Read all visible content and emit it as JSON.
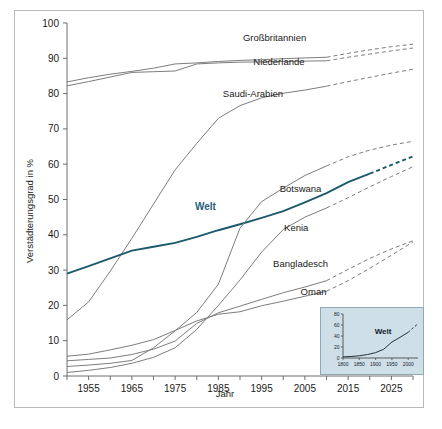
{
  "chart_data": {
    "type": "line",
    "title": "",
    "xlabel": "Jahr",
    "ylabel": "Verstädterungsgrad in %",
    "xlim": [
      1950,
      2030
    ],
    "ylim": [
      0,
      100
    ],
    "grid": false,
    "legend": "inline-labels",
    "yticks": [
      0,
      10,
      20,
      30,
      40,
      50,
      60,
      70,
      80,
      90,
      100
    ],
    "xticks": [
      1955,
      1965,
      1975,
      1985,
      1995,
      2005,
      2015,
      2025
    ],
    "xticks_minor": [
      1950,
      1960,
      1970,
      1980,
      1990,
      2000,
      2010,
      2020,
      2030
    ],
    "x": [
      1950,
      1955,
      1960,
      1965,
      1970,
      1975,
      1980,
      1985,
      1990,
      1995,
      2000,
      2005,
      2010,
      2015,
      2020,
      2025,
      2030
    ],
    "series": [
      {
        "name": "Großbritannien",
        "color": "#7d7d7d",
        "label_x": 1998,
        "label_y": 95,
        "observed": [
          83.3,
          84.5,
          85.5,
          86.3,
          87.2,
          88.4,
          88.7,
          89.1,
          89.4,
          89.6,
          89.9,
          90.1,
          90.3
        ],
        "projected": [
          90.3,
          91.4,
          92.4,
          93.3,
          94.0
        ]
      },
      {
        "name": "Niederlande",
        "color": "#7d7d7d",
        "label_x": 1999,
        "label_y": 88,
        "observed": [
          82.2,
          83.4,
          84.7,
          86.0,
          86.2,
          86.4,
          88.4,
          88.7,
          88.9,
          89.0,
          89.1,
          89.2,
          89.3
        ],
        "projected": [
          89.3,
          90.3,
          91.2,
          92.1,
          92.9
        ]
      },
      {
        "name": "Saudi-Arabien",
        "color": "#7d7d7d",
        "label_x": 1993,
        "label_y": 79,
        "observed": [
          15.9,
          21.0,
          29.7,
          39.0,
          48.7,
          58.4,
          65.9,
          73.0,
          76.6,
          78.8,
          80.1,
          81.0,
          82.1
        ],
        "projected": [
          82.1,
          83.4,
          84.6,
          85.8,
          86.9
        ]
      },
      {
        "name": "Welt",
        "color": "#1c5a6b",
        "label_x": 1982,
        "label_y": 47,
        "observed": [
          29.0,
          31.1,
          33.3,
          35.5,
          36.6,
          37.7,
          39.4,
          41.3,
          43.0,
          44.8,
          46.7,
          49.2,
          51.8,
          54.9,
          57.3
        ],
        "projected": [
          57.3,
          59.8,
          62.2
        ]
      },
      {
        "name": "Botswana",
        "color": "#7d7d7d",
        "label_x": 2004,
        "label_y": 52,
        "observed": [
          2.7,
          3.1,
          3.6,
          4.4,
          8.0,
          12.8,
          18.0,
          26.0,
          41.9,
          49.4,
          53.2,
          56.8,
          59.5
        ],
        "projected": [
          59.5,
          62.1,
          64.0,
          65.4,
          66.5
        ]
      },
      {
        "name": "Kenia",
        "color": "#7d7d7d",
        "label_x": 2003,
        "label_y": 41,
        "observed": [
          5.6,
          6.2,
          7.4,
          8.7,
          10.3,
          12.9,
          15.6,
          17.5,
          18.2,
          19.9,
          21.2,
          22.6,
          24.0
        ],
        "projected": [
          24.0,
          27.0,
          30.5,
          34.2,
          38.0
        ]
      },
      {
        "name": "Bangladesch",
        "color": "#7d7d7d",
        "label_x": 2004,
        "label_y": 31,
        "observed": [
          4.3,
          4.7,
          5.1,
          6.1,
          7.6,
          9.9,
          14.9,
          17.9,
          19.8,
          21.7,
          23.6,
          25.2,
          27.0
        ],
        "projected": [
          27.0,
          30.2,
          33.3,
          36.0,
          38.3
        ]
      },
      {
        "name": "Oman",
        "color": "#7d7d7d",
        "label_x": 2007,
        "label_y": 23,
        "observed": [
          1.0,
          1.6,
          2.4,
          3.6,
          5.3,
          8.0,
          13.2,
          20.0,
          27.2,
          35.1,
          41.5,
          45.0,
          47.6
        ],
        "projected": [
          47.6,
          50.5,
          53.6,
          56.5,
          59.3
        ]
      }
    ]
  },
  "inset": {
    "title": "",
    "series_label": "Welt",
    "ylim": [
      0,
      80
    ],
    "yticks": [
      0,
      20,
      40,
      60,
      80
    ],
    "xticks": [
      1800,
      1850,
      1900,
      1950,
      2000
    ],
    "xlim": [
      1800,
      2030
    ],
    "observed_x": [
      1800,
      1825,
      1850,
      1875,
      1900,
      1925,
      1950,
      1975,
      2000
    ],
    "observed_y": [
      2.0,
      2.8,
      4.0,
      6.3,
      9.8,
      16.0,
      29.0,
      37.7,
      46.7
    ],
    "projected_x": [
      2000,
      2015,
      2030
    ],
    "projected_y": [
      46.7,
      54.9,
      62.2
    ]
  }
}
